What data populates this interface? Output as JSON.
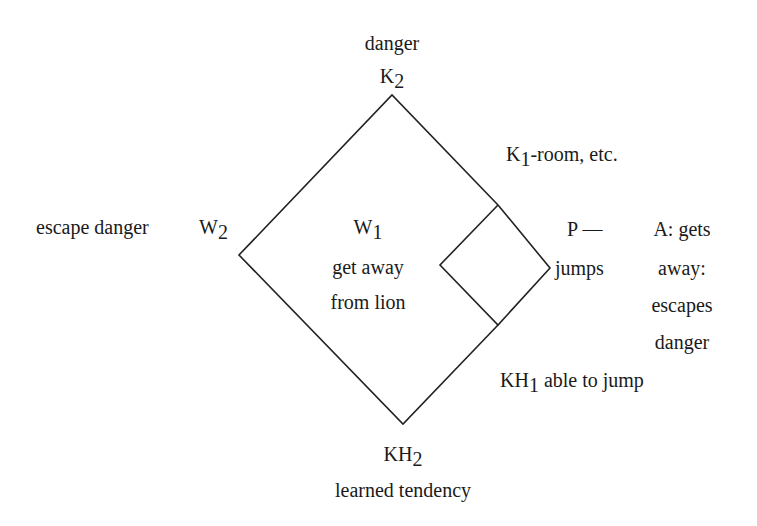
{
  "diagram": {
    "line_color": "#222222",
    "top": {
      "label": "danger",
      "node": "K",
      "node_sub": "2"
    },
    "left": {
      "label": "escape danger",
      "node": "W",
      "node_sub": "2"
    },
    "center": {
      "node": "W",
      "node_sub": "1",
      "line1": "get away",
      "line2": "from lion"
    },
    "upper_right": {
      "node": "K",
      "node_sub": "1",
      "text": "-room, etc."
    },
    "right": {
      "p_label": "P —",
      "p_sub": "jumps"
    },
    "outcome": {
      "line1": "A: gets",
      "line2": "away:",
      "line3": "escapes",
      "line4": "danger"
    },
    "lower_right": {
      "node": "KH",
      "node_sub": "1",
      "text": " able to jump"
    },
    "bottom": {
      "node": "KH",
      "node_sub": "2",
      "label": "learned tendency"
    }
  }
}
